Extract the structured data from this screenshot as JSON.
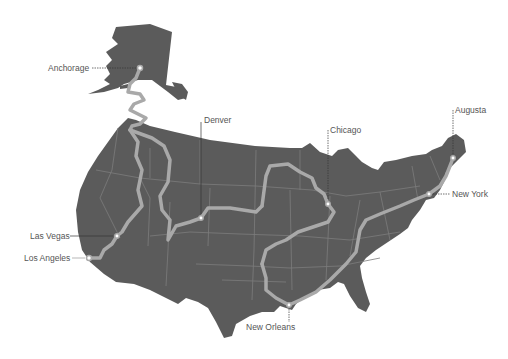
{
  "map": {
    "type": "route-map",
    "region": "United States",
    "colors": {
      "land": "#5b5b5b",
      "state_border": "#7c7c7c",
      "route": "#a9a9a9",
      "background": "#ffffff",
      "label_text": "#555555",
      "leader_line": "#333333"
    },
    "cities": [
      {
        "name": "Anchorage",
        "x": 140,
        "y": 68,
        "label_x": 48,
        "label_y": 64
      },
      {
        "name": "Denver",
        "x": 201,
        "y": 218,
        "label_x": 204,
        "label_y": 116
      },
      {
        "name": "Chicago",
        "x": 328,
        "y": 204,
        "label_x": 330,
        "label_y": 126
      },
      {
        "name": "Augusta",
        "x": 453,
        "y": 158,
        "label_x": 455,
        "label_y": 106
      },
      {
        "name": "New York",
        "x": 429,
        "y": 194,
        "label_x": 452,
        "label_y": 190
      },
      {
        "name": "Las Vegas",
        "x": 117,
        "y": 236,
        "label_x": 30,
        "label_y": 232
      },
      {
        "name": "Los Angeles",
        "x": 89,
        "y": 258,
        "label_x": 24,
        "label_y": 254
      },
      {
        "name": "New Orleans",
        "x": 289,
        "y": 305,
        "label_x": 246,
        "label_y": 322
      }
    ]
  }
}
